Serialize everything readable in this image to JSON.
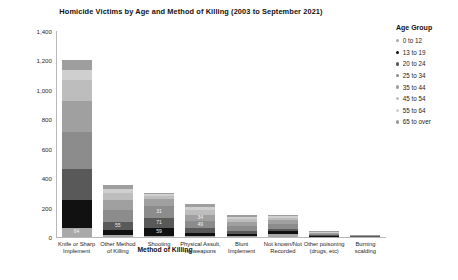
{
  "chart_data": {
    "type": "bar",
    "subtype": "stacked-vertical",
    "title": "Homicide Victims by Age and Method of Killing (2003 to September 2021)",
    "xlabel": "Method of Killing",
    "ylabel": "Count of Method of Killing",
    "ylim": [
      0,
      1400
    ],
    "yticks": [
      "0",
      "200",
      "400",
      "600",
      "800",
      "1,000",
      "1,200",
      "1,400"
    ],
    "ytick_values": [
      0,
      200,
      400,
      600,
      800,
      1000,
      1200,
      1400
    ],
    "grid": false,
    "legend_position": "right",
    "legend_title": "Age Group",
    "categories": [
      "Knife or Sharp Implement",
      "Other Method of Killing",
      "Shooting",
      "Physical Assult, no weapons",
      "Blunt Implement",
      "Not known/Not Recorded",
      "Other poisoning (drugs, etc)",
      "Burning scalding"
    ],
    "series": [
      {
        "name": "0 to 12",
        "color": "#a9a9a9",
        "values": [
          64,
          16,
          5,
          10,
          9,
          22,
          3,
          4
        ]
      },
      {
        "name": "13 to 19",
        "color": "#111111",
        "values": [
          185,
          29,
          55,
          17,
          11,
          16,
          4,
          2
        ]
      },
      {
        "name": "20 to 24",
        "color": "#595959",
        "values": [
          214,
          59,
          71,
          31,
          19,
          19,
          5,
          2
        ]
      },
      {
        "name": "25 to 34",
        "color": "#8c8c8c",
        "values": [
          251,
          82,
          78,
          49,
          34,
          30,
          9,
          3
        ]
      },
      {
        "name": "35 to 44",
        "color": "#a0a0a0",
        "values": [
          208,
          67,
          47,
          41,
          26,
          26,
          7,
          2
        ]
      },
      {
        "name": "45 to 54",
        "color": "#bdbdbd",
        "values": [
          148,
          48,
          26,
          34,
          22,
          18,
          5,
          1
        ]
      },
      {
        "name": "55 to 64",
        "color": "#cfcfcf",
        "values": [
          65,
          27,
          12,
          21,
          14,
          11,
          3,
          1
        ]
      },
      {
        "name": "65 to over",
        "color": "#9e9e9e",
        "values": [
          65,
          24,
          6,
          19,
          15,
          10,
          2,
          1
        ]
      }
    ],
    "segment_labels": {
      "0": [
        "64",
        "185",
        "214",
        "251",
        "208",
        "148",
        "65",
        "65"
      ],
      "1": [
        "",
        "29",
        "59",
        "82",
        "67",
        "48",
        "27",
        "24"
      ],
      "2": [
        "",
        "55",
        "71",
        "78",
        "47",
        "26",
        "",
        ""
      ],
      "3": [
        "",
        "",
        "31",
        "49",
        "41",
        "34",
        "21",
        "19"
      ],
      "4": [
        "",
        "",
        "",
        "34",
        "26",
        "22",
        "",
        ""
      ],
      "5": [
        "",
        "",
        "",
        "30",
        "26",
        "",
        "",
        ""
      ],
      "6": [
        "",
        "",
        "",
        "",
        "",
        "",
        "",
        ""
      ],
      "7": [
        "",
        "",
        "",
        "",
        "",
        "",
        "",
        ""
      ]
    }
  }
}
